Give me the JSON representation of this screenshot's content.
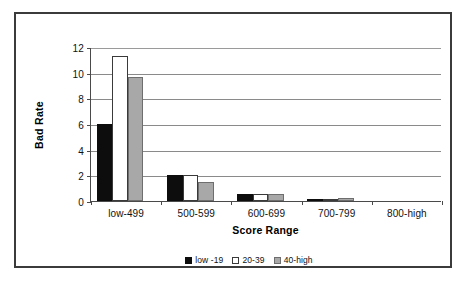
{
  "chart_data": {
    "type": "bar",
    "title": "",
    "xlabel": "Score Range",
    "ylabel": "Bad Rate",
    "categories": [
      "low-499",
      "500-599",
      "600-699",
      "700-799",
      "800-high"
    ],
    "series": [
      {
        "name": "low -19",
        "color": "#0d0d0d",
        "values": [
          6.0,
          2.0,
          0.55,
          0.1,
          0
        ]
      },
      {
        "name": "20-39",
        "color": "#ffffff",
        "values": [
          11.3,
          2.0,
          0.55,
          0.18,
          0
        ]
      },
      {
        "name": "40-high",
        "color": "#a8a8a8",
        "values": [
          9.7,
          1.5,
          0.55,
          0.25,
          0
        ]
      }
    ],
    "ylim": [
      0,
      12
    ],
    "yticks": [
      0,
      2,
      4,
      6,
      8,
      10,
      12
    ],
    "ytick_labels": [
      "0",
      "2",
      "4",
      "6",
      "8",
      "10",
      "12"
    ],
    "grid": true,
    "grid_axis": "y",
    "legend_position": "bottom-center"
  },
  "figure": {
    "border_color": "#3b3b3b",
    "background": "#ffffff",
    "axis_color": "#4a4a4a",
    "gridline_color": "#8a8a8a"
  }
}
